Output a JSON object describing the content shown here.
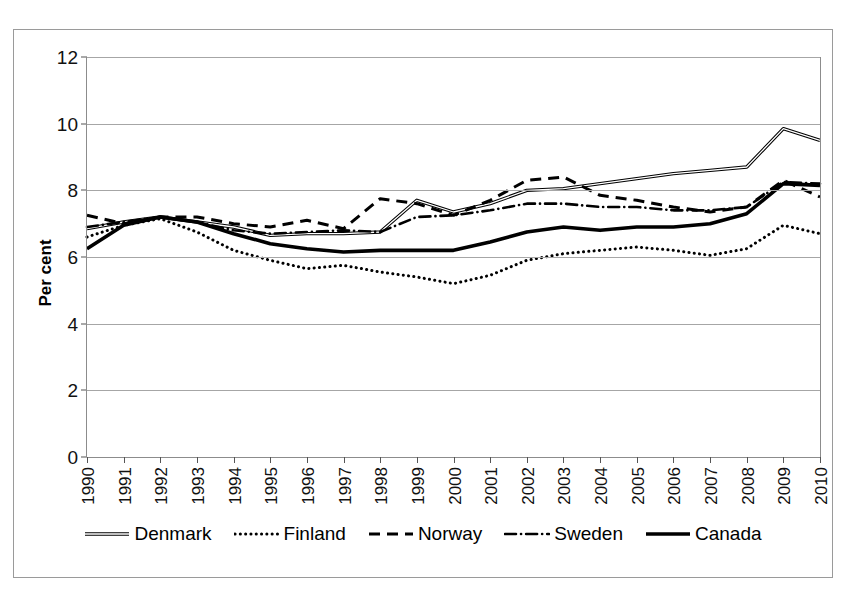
{
  "figure": {
    "title_clipped": "",
    "frame_color": "#9a9a9a"
  },
  "axes": {
    "ylabel": "Per cent",
    "yticks": [
      "0",
      "2",
      "4",
      "6",
      "8",
      "10",
      "12"
    ],
    "xticks": [
      "1990",
      "1991",
      "1992",
      "1993",
      "1994",
      "1995",
      "1996",
      "1997",
      "1998",
      "1999",
      "2000",
      "2001",
      "2002",
      "2003",
      "2004",
      "2005",
      "2006",
      "2007",
      "2008",
      "2009",
      "2010"
    ]
  },
  "legend": {
    "items": [
      {
        "label": "Denmark",
        "style": "double-thin-solid",
        "color": "#000000"
      },
      {
        "label": "Finland",
        "style": "dotted",
        "color": "#000000"
      },
      {
        "label": "Norway",
        "style": "dashed",
        "color": "#000000"
      },
      {
        "label": "Sweden",
        "style": "dash-dot",
        "color": "#000000"
      },
      {
        "label": "Canada",
        "style": "thick-solid",
        "color": "#000000"
      }
    ]
  },
  "chart_data": {
    "type": "line",
    "title": "",
    "xlabel": "",
    "ylabel": "Per cent",
    "ylim": [
      0,
      12
    ],
    "ytick_step": 2,
    "grid": true,
    "legend_position": "bottom",
    "x": [
      1990,
      1991,
      1992,
      1993,
      1994,
      1995,
      1996,
      1997,
      1998,
      1999,
      2000,
      2001,
      2002,
      2003,
      2004,
      2005,
      2006,
      2007,
      2008,
      2009,
      2010
    ],
    "series": [
      {
        "name": "Denmark",
        "style": "double-thin-solid",
        "values": [
          6.85,
          7.05,
          7.2,
          7.05,
          6.9,
          6.65,
          6.7,
          6.7,
          6.75,
          7.7,
          7.35,
          7.6,
          8.0,
          8.05,
          8.2,
          8.35,
          8.5,
          8.6,
          8.7,
          9.85,
          9.5
        ]
      },
      {
        "name": "Finland",
        "style": "dotted",
        "values": [
          6.6,
          6.95,
          7.15,
          6.75,
          6.2,
          5.9,
          5.65,
          5.75,
          5.55,
          5.4,
          5.2,
          5.45,
          5.9,
          6.1,
          6.2,
          6.3,
          6.2,
          6.05,
          6.25,
          6.95,
          6.7
        ]
      },
      {
        "name": "Norway",
        "style": "dashed",
        "values": [
          7.25,
          7.0,
          7.2,
          7.2,
          7.0,
          6.9,
          7.1,
          6.85,
          7.75,
          7.6,
          7.25,
          7.7,
          8.3,
          8.4,
          7.85,
          7.7,
          7.5,
          7.35,
          7.5,
          8.3,
          7.8
        ]
      },
      {
        "name": "Sweden",
        "style": "dash-dot",
        "values": [
          6.9,
          7.05,
          7.2,
          7.05,
          6.8,
          6.7,
          6.75,
          6.8,
          6.75,
          7.2,
          7.25,
          7.4,
          7.6,
          7.6,
          7.5,
          7.5,
          7.4,
          7.4,
          7.5,
          8.25,
          8.2
        ]
      },
      {
        "name": "Canada",
        "style": "thick-solid",
        "values": [
          6.25,
          6.95,
          7.2,
          7.05,
          6.7,
          6.4,
          6.25,
          6.15,
          6.2,
          6.2,
          6.2,
          6.45,
          6.75,
          6.9,
          6.8,
          6.9,
          6.9,
          7.0,
          7.3,
          8.2,
          8.15
        ]
      }
    ]
  }
}
